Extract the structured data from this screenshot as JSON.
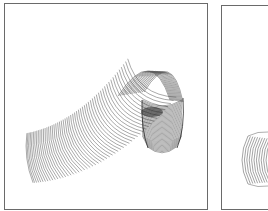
{
  "figure": {
    "panels": [
      {
        "id": "left",
        "subject": "slinky-arched",
        "description": "Line drawing of a coiled spring toy arching from lower-left up and over, with the compressed end folded down on the right"
      },
      {
        "id": "right",
        "subject": "slinky-partial",
        "description": "Partial view of a coiled spring toy, cropped by the right image edge"
      }
    ],
    "colors": {
      "line": "#555555",
      "dense": "#2a2a2a",
      "border": "#6a6a6a",
      "background": "#ffffff"
    }
  }
}
